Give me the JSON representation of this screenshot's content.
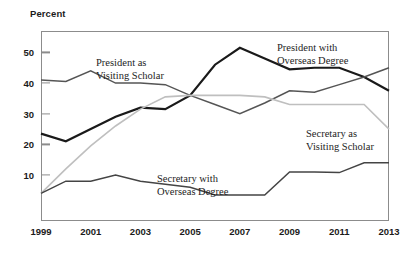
{
  "chart_data": {
    "type": "line",
    "title": "",
    "ylabel": "Percent",
    "xlabel": "",
    "ylim": [
      -5,
      57
    ],
    "xlim": [
      1999,
      2013
    ],
    "grid": false,
    "legend_position": "inline-annotations",
    "yticks": [
      10,
      20,
      30,
      40,
      50
    ],
    "xticks": [
      1999,
      2001,
      2003,
      2005,
      2007,
      2009,
      2011,
      2013
    ],
    "xtick_labels": [
      "1999",
      "2001",
      "2003",
      "2005",
      "2007",
      "2009",
      "2011",
      "2013"
    ],
    "x": [
      1999,
      2000,
      2001,
      2002,
      2003,
      2004,
      2005,
      2006,
      2007,
      2008,
      2009,
      2010,
      2011,
      2012,
      2013
    ],
    "series": [
      {
        "name": "President with Overseas Degree",
        "color": "#1a1a1a",
        "width": 2.2,
        "values": [
          23.5,
          21,
          25,
          29,
          32,
          31.5,
          36,
          46,
          51.5,
          48,
          44.5,
          45,
          45,
          42,
          37.5
        ]
      },
      {
        "name": "President as Visiting Scholar",
        "color": "#555555",
        "width": 1.5,
        "values": [
          41,
          40.5,
          44,
          40,
          40,
          39.5,
          36,
          33,
          30,
          33.5,
          37.5,
          37,
          39.5,
          42,
          45
        ]
      },
      {
        "name": "Secretary as Visiting Scholar",
        "color": "#bfbfbf",
        "width": 1.6,
        "values": [
          4,
          12,
          19.5,
          26,
          31.5,
          35.5,
          36,
          36,
          36,
          35.5,
          33,
          33,
          33,
          33,
          25
        ]
      },
      {
        "name": "Secretary with Overseas Degree",
        "color": "#444444",
        "width": 1.5,
        "values": [
          4,
          8,
          8,
          10,
          8,
          7,
          6,
          3.5,
          3.5,
          3.5,
          11,
          11,
          10.8,
          14,
          14
        ]
      }
    ],
    "annotations": [
      {
        "id": "pres-vs",
        "text": "President as\nVisiting Scholar"
      },
      {
        "id": "pres-od",
        "text": "President with\nOverseas Degree"
      },
      {
        "id": "sec-vs",
        "text": "Secretary as\nVisiting Scholar"
      },
      {
        "id": "sec-od",
        "text": "Secretary with\nOverseas Degree"
      }
    ]
  }
}
